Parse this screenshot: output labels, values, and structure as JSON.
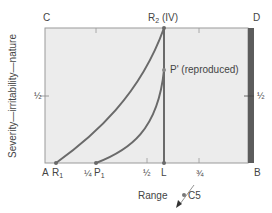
{
  "diagram": {
    "corners": {
      "top_left": "C",
      "top_right": "D",
      "bottom_left": "A",
      "bottom_right": "B"
    },
    "y_axis_label": "Severity—irritability—nature",
    "x_axis_label": "Range",
    "left_half_label": "½",
    "right_half_label": "½",
    "bottom_ticks": [
      {
        "label": "¼",
        "position": 0.25
      },
      {
        "label": "½",
        "position": 0.5
      },
      {
        "label": "¾",
        "position": 0.75
      }
    ],
    "points": {
      "R1": {
        "name": "R",
        "sub": "1"
      },
      "P1": {
        "name": "P",
        "sub": "1"
      },
      "L": {
        "name": "L"
      },
      "R2": {
        "name": "R",
        "sub": "2",
        "suffix": " (IV)"
      },
      "P_prime": {
        "label": "P' (reproduced)"
      }
    },
    "c5_label": "C5",
    "colors": {
      "box_fill": "#ececec",
      "box_border": "#8a8a8a",
      "curve": "#6a6a6a",
      "right_bar": "#5a5a5a"
    }
  }
}
